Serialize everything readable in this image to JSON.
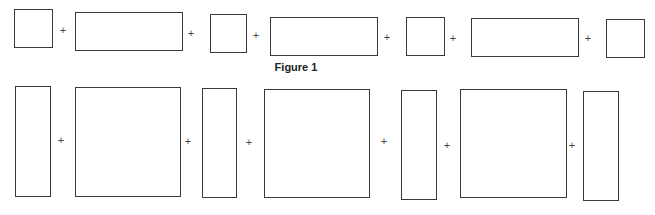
{
  "figure": {
    "caption": "Figure 1",
    "caption_pos": {
      "x": 296,
      "y": 61
    },
    "plus_symbol": "+",
    "rows": [
      {
        "name": "top-row",
        "boxes": [
          {
            "x": 14,
            "y": 9,
            "w": 39,
            "h": 39
          },
          {
            "x": 75,
            "y": 12,
            "w": 108,
            "h": 39
          },
          {
            "x": 210,
            "y": 14,
            "w": 37,
            "h": 39
          },
          {
            "x": 270,
            "y": 17,
            "w": 108,
            "h": 39
          },
          {
            "x": 406,
            "y": 17,
            "w": 39,
            "h": 39
          },
          {
            "x": 471,
            "y": 18,
            "w": 108,
            "h": 39
          },
          {
            "x": 606,
            "y": 19,
            "w": 39,
            "h": 39
          }
        ],
        "pluses": [
          {
            "x": 63,
            "y": 30
          },
          {
            "x": 191,
            "y": 33
          },
          {
            "x": 256,
            "y": 35
          },
          {
            "x": 387,
            "y": 37
          },
          {
            "x": 453,
            "y": 38
          },
          {
            "x": 588,
            "y": 38
          }
        ]
      },
      {
        "name": "bottom-row",
        "boxes": [
          {
            "x": 15,
            "y": 86,
            "w": 36,
            "h": 111
          },
          {
            "x": 75,
            "y": 87,
            "w": 106,
            "h": 110
          },
          {
            "x": 202,
            "y": 88,
            "w": 35,
            "h": 110
          },
          {
            "x": 264,
            "y": 89,
            "w": 106,
            "h": 109
          },
          {
            "x": 401,
            "y": 90,
            "w": 36,
            "h": 110
          },
          {
            "x": 460,
            "y": 89,
            "w": 107,
            "h": 109
          },
          {
            "x": 583,
            "y": 91,
            "w": 36,
            "h": 110
          }
        ],
        "pluses": [
          {
            "x": 61,
            "y": 140
          },
          {
            "x": 188,
            "y": 141
          },
          {
            "x": 249,
            "y": 142
          },
          {
            "x": 384,
            "y": 141
          },
          {
            "x": 447,
            "y": 145
          },
          {
            "x": 572,
            "y": 145
          }
        ]
      }
    ]
  }
}
